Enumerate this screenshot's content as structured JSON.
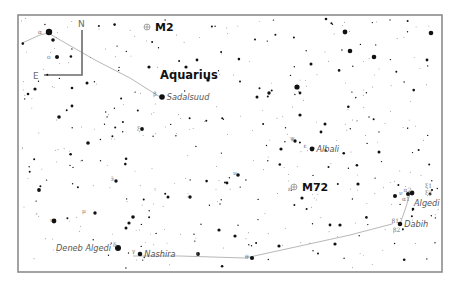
{
  "chart_title": "Aquarius / Capricornus star chart",
  "compass": {
    "north": "N",
    "east": "E"
  },
  "constellation": {
    "label": "Aquarius",
    "x": 160,
    "y": 79
  },
  "deep_sky_objects": [
    {
      "id": "m2",
      "label": "M2",
      "x": 155,
      "y": 31
    },
    {
      "id": "m72",
      "label": "M72",
      "x": 302,
      "y": 191
    }
  ],
  "named_stars": [
    {
      "id": "sadalsuud",
      "label": "Sadalsuud",
      "greek": "β",
      "x": 162,
      "y": 97,
      "r": 2.8
    },
    {
      "id": "albali",
      "label": "Albali",
      "greek": "ε",
      "x": 312,
      "y": 149,
      "r": 2.4
    },
    {
      "id": "algedi",
      "label": "Algedi",
      "greek": "α2",
      "x": 412,
      "y": 193,
      "r": 2.4
    },
    {
      "id": "dabih",
      "label": "Dabih",
      "greek": "β1",
      "x": 400,
      "y": 224,
      "r": 2.3
    },
    {
      "id": "nashira",
      "label": "Nashira",
      "greek": "γ",
      "x": 140,
      "y": 254,
      "r": 2.3
    },
    {
      "id": "deneb-algedi",
      "label": "Deneb Algedi",
      "greek": "δ",
      "x": 118,
      "y": 248,
      "r": 3.0
    }
  ],
  "greek_labels": [
    {
      "text": "α",
      "x": 38,
      "y": 34
    },
    {
      "text": "ο",
      "x": 47,
      "y": 59
    },
    {
      "text": "ξ",
      "x": 137,
      "y": 131
    },
    {
      "text": "λ",
      "x": 111,
      "y": 181
    },
    {
      "text": "μ",
      "x": 82,
      "y": 213
    },
    {
      "text": "ι",
      "x": 50,
      "y": 222
    },
    {
      "text": "ν",
      "x": 233,
      "y": 175
    },
    {
      "text": "ψ",
      "x": 290,
      "y": 140
    },
    {
      "text": "α1",
      "x": 402,
      "y": 201
    },
    {
      "text": "ν",
      "x": 399,
      "y": 195
    },
    {
      "text": "ξ1",
      "x": 425,
      "y": 188
    },
    {
      "text": "ξ2",
      "x": 425,
      "y": 195
    },
    {
      "text": "β2",
      "x": 393,
      "y": 232
    },
    {
      "text": "θ",
      "x": 245,
      "y": 259
    },
    {
      "text": "ι",
      "x": 196,
      "y": 255
    },
    {
      "text": "ε",
      "x": 288,
      "y": 191
    }
  ],
  "colors": {
    "frame": "#8c8c8c",
    "star": "#111111",
    "ecliptic": "#b8b8b8",
    "label": "#555555"
  }
}
